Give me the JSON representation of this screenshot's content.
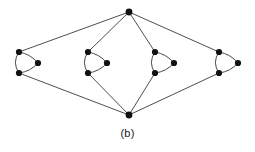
{
  "figure": {
    "caption": "(b)",
    "kind": "graph-diagram",
    "width": 255,
    "height": 152,
    "background_color": "#ffffff",
    "edge_color": "#3a3a3a",
    "arc_color": "#4a4a4a",
    "vertex_color": "#111111",
    "vertex_radius": 3.1,
    "apex_radius": 3.4,
    "edge_width": 0.9,
    "arc_width": 1.0
  },
  "chart_data": {
    "type": "scatter",
    "title": "(b)",
    "xlabel": "",
    "ylabel": "",
    "xlim": [
      0,
      255
    ],
    "ylim": [
      0,
      152
    ],
    "grid": false,
    "legend": "none",
    "vertices": [
      {
        "id": "top-apex",
        "label": "",
        "x": 129,
        "y": 12,
        "role": "apex"
      },
      {
        "id": "bottom-apex",
        "label": "",
        "x": 129,
        "y": 115,
        "role": "apex"
      },
      {
        "id": "c1-top",
        "label": "",
        "x": 19,
        "y": 52,
        "role": "cluster-node",
        "cluster": 1
      },
      {
        "id": "c1-bottom",
        "label": "",
        "x": 19,
        "y": 73,
        "role": "cluster-node",
        "cluster": 1
      },
      {
        "id": "c1-side",
        "label": "",
        "x": 38,
        "y": 63,
        "role": "cluster-node",
        "cluster": 1
      },
      {
        "id": "c2-top",
        "label": "",
        "x": 88,
        "y": 52,
        "role": "cluster-node",
        "cluster": 2
      },
      {
        "id": "c2-bottom",
        "label": "",
        "x": 88,
        "y": 73,
        "role": "cluster-node",
        "cluster": 2
      },
      {
        "id": "c2-side",
        "label": "",
        "x": 107,
        "y": 63,
        "role": "cluster-node",
        "cluster": 2
      },
      {
        "id": "c3-top",
        "label": "",
        "x": 155,
        "y": 52,
        "role": "cluster-node",
        "cluster": 3
      },
      {
        "id": "c3-bottom",
        "label": "",
        "x": 155,
        "y": 73,
        "role": "cluster-node",
        "cluster": 3
      },
      {
        "id": "c3-side",
        "label": "",
        "x": 174,
        "y": 63,
        "role": "cluster-node",
        "cluster": 3
      },
      {
        "id": "c4-top",
        "label": "",
        "x": 219,
        "y": 52,
        "role": "cluster-node",
        "cluster": 4
      },
      {
        "id": "c4-bottom",
        "label": "",
        "x": 219,
        "y": 73,
        "role": "cluster-node",
        "cluster": 4
      },
      {
        "id": "c4-side",
        "label": "",
        "x": 238,
        "y": 63,
        "role": "cluster-node",
        "cluster": 4
      }
    ],
    "straight_edges": [
      {
        "from": "top-apex",
        "to": "c1-top"
      },
      {
        "from": "top-apex",
        "to": "c2-top"
      },
      {
        "from": "top-apex",
        "to": "c3-top"
      },
      {
        "from": "top-apex",
        "to": "c4-top"
      },
      {
        "from": "bottom-apex",
        "to": "c1-bottom"
      },
      {
        "from": "bottom-apex",
        "to": "c2-bottom"
      },
      {
        "from": "bottom-apex",
        "to": "c3-bottom"
      },
      {
        "from": "bottom-apex",
        "to": "c4-bottom"
      }
    ],
    "arc_edges": [
      {
        "from": "c1-top",
        "to": "c1-side",
        "bulge": "up-right"
      },
      {
        "from": "c1-side",
        "to": "c1-bottom",
        "bulge": "down-right"
      },
      {
        "from": "c1-top",
        "to": "c1-bottom",
        "bulge": "left"
      },
      {
        "from": "c2-top",
        "to": "c2-side",
        "bulge": "up-right"
      },
      {
        "from": "c2-side",
        "to": "c2-bottom",
        "bulge": "down-right"
      },
      {
        "from": "c2-top",
        "to": "c2-bottom",
        "bulge": "left"
      },
      {
        "from": "c3-top",
        "to": "c3-side",
        "bulge": "up-right"
      },
      {
        "from": "c3-side",
        "to": "c3-bottom",
        "bulge": "down-right"
      },
      {
        "from": "c3-top",
        "to": "c3-bottom",
        "bulge": "left"
      },
      {
        "from": "c4-top",
        "to": "c4-side",
        "bulge": "up-right"
      },
      {
        "from": "c4-side",
        "to": "c4-bottom",
        "bulge": "down-right"
      },
      {
        "from": "c4-top",
        "to": "c4-bottom",
        "bulge": "left"
      }
    ],
    "clusters": [
      {
        "index": 1,
        "center_x": 27,
        "center_y": 63,
        "node_count": 3
      },
      {
        "index": 2,
        "center_x": 96,
        "center_y": 63,
        "node_count": 3
      },
      {
        "index": 3,
        "center_x": 163,
        "center_y": 63,
        "node_count": 3
      },
      {
        "index": 4,
        "center_x": 227,
        "center_y": 63,
        "node_count": 3
      }
    ]
  }
}
